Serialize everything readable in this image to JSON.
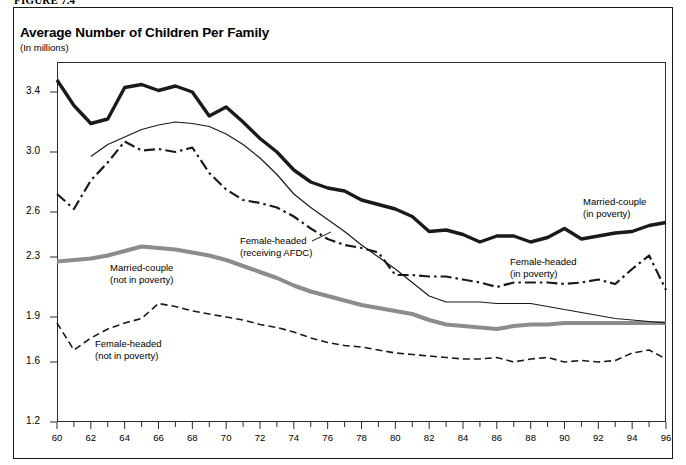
{
  "figure": {
    "number": "FIGURE 7.4",
    "title": "Average Number of Children Per Family",
    "subtitle": "(In millions)"
  },
  "chart_data": {
    "type": "line",
    "title": "Average Number of Children Per Family",
    "subtitle": "(In millions)",
    "xlabel": "",
    "ylabel": "",
    "xlim": [
      60,
      96
    ],
    "ylim": [
      1.2,
      3.6
    ],
    "grid": false,
    "legend_position": "inline-annotations",
    "ytick_labels": [
      "3.4",
      "3.0",
      "2.6",
      "2.3",
      "1.9",
      "1.6",
      "1.2"
    ],
    "ytick_values": [
      3.4,
      3.0,
      2.6,
      2.3,
      1.9,
      1.6,
      1.2
    ],
    "xtick_labels": [
      "60",
      "62",
      "64",
      "66",
      "68",
      "70",
      "72",
      "74",
      "76",
      "78",
      "80",
      "82",
      "84",
      "86",
      "88",
      "90",
      "92",
      "94",
      "96"
    ],
    "xtick_values": [
      60,
      62,
      64,
      66,
      68,
      70,
      72,
      74,
      76,
      78,
      80,
      82,
      84,
      86,
      88,
      90,
      92,
      94,
      96
    ],
    "x": [
      60,
      61,
      62,
      63,
      64,
      65,
      66,
      67,
      68,
      69,
      70,
      71,
      72,
      73,
      74,
      75,
      76,
      77,
      78,
      79,
      80,
      81,
      82,
      83,
      84,
      85,
      86,
      87,
      88,
      89,
      90,
      91,
      92,
      93,
      94,
      95,
      96
    ],
    "series": [
      {
        "name": "Married-couple (in poverty)",
        "style": "thick-black-solid",
        "color": "#1a1a1a",
        "values": [
          3.48,
          3.31,
          3.19,
          3.22,
          3.43,
          3.45,
          3.41,
          3.44,
          3.4,
          3.24,
          3.3,
          3.2,
          3.09,
          3.0,
          2.88,
          2.8,
          2.76,
          2.74,
          2.68,
          2.65,
          2.62,
          2.57,
          2.47,
          2.48,
          2.45,
          2.4,
          2.44,
          2.44,
          2.4,
          2.43,
          2.49,
          2.42,
          2.44,
          2.46,
          2.47,
          2.51,
          2.53
        ]
      },
      {
        "name": "Married-couple (not in poverty)",
        "style": "thick-gray-solid",
        "color": "#8c8c8c",
        "values": [
          2.27,
          2.28,
          2.29,
          2.31,
          2.34,
          2.37,
          2.36,
          2.35,
          2.33,
          2.31,
          2.28,
          2.24,
          2.2,
          2.16,
          2.11,
          2.07,
          2.04,
          2.01,
          1.98,
          1.96,
          1.94,
          1.92,
          1.88,
          1.85,
          1.84,
          1.83,
          1.82,
          1.84,
          1.85,
          1.85,
          1.86,
          1.86,
          1.86,
          1.86,
          1.86,
          1.86,
          1.86
        ]
      },
      {
        "name": "Female-headed (receiving AFDC)",
        "style": "thin-black-solid",
        "color": "#1a1a1a",
        "values": [
          null,
          null,
          2.97,
          3.05,
          3.1,
          3.15,
          3.18,
          3.2,
          3.19,
          3.17,
          3.12,
          3.05,
          2.96,
          2.85,
          2.72,
          2.63,
          2.55,
          2.47,
          2.38,
          2.3,
          2.22,
          2.13,
          2.04,
          2.0,
          2.0,
          2.0,
          1.99,
          1.99,
          1.99,
          1.97,
          1.95,
          1.93,
          1.91,
          1.89,
          1.88,
          1.87,
          1.86
        ]
      },
      {
        "name": "Female-headed (in poverty)",
        "style": "dash-dot-black",
        "color": "#1a1a1a",
        "values": [
          2.72,
          2.62,
          2.81,
          2.93,
          3.07,
          3.01,
          3.02,
          3.0,
          3.03,
          2.86,
          2.75,
          2.68,
          2.66,
          2.63,
          2.57,
          2.49,
          2.42,
          2.38,
          2.36,
          2.33,
          2.18,
          2.18,
          2.17,
          2.17,
          2.15,
          2.13,
          2.1,
          2.13,
          2.13,
          2.13,
          2.12,
          2.13,
          2.15,
          2.12,
          2.22,
          2.31,
          2.08
        ]
      },
      {
        "name": "Female-headed (not in poverty)",
        "style": "dashed-black",
        "color": "#1a1a1a",
        "values": [
          1.86,
          1.68,
          1.76,
          1.82,
          1.86,
          1.89,
          1.99,
          1.97,
          1.94,
          1.92,
          1.9,
          1.88,
          1.85,
          1.83,
          1.8,
          1.76,
          1.73,
          1.71,
          1.7,
          1.68,
          1.66,
          1.65,
          1.64,
          1.63,
          1.62,
          1.62,
          1.63,
          1.6,
          1.62,
          1.63,
          1.6,
          1.61,
          1.6,
          1.61,
          1.66,
          1.68,
          1.62
        ]
      }
    ],
    "annotations": [
      {
        "id": "married-in-poverty",
        "text_line1": "Married-couple",
        "text_line2": "(in poverty)",
        "x_px": 583,
        "y_px": 196
      },
      {
        "id": "married-not-in-poverty",
        "text_line1": "Married-couple",
        "text_line2": "(not in poverty)",
        "x_px": 110,
        "y_px": 262
      },
      {
        "id": "female-afdc",
        "text_line1": "Female-headed",
        "text_line2": "(receiving AFDC)",
        "x_px": 240,
        "y_px": 235
      },
      {
        "id": "female-in-poverty",
        "text_line1": "Female-headed",
        "text_line2": "(in poverty)",
        "x_px": 510,
        "y_px": 256
      },
      {
        "id": "female-not-in-poverty",
        "text_line1": "Female-headed",
        "text_line2": "(not in poverty)",
        "x_px": 95,
        "y_px": 338
      }
    ]
  }
}
